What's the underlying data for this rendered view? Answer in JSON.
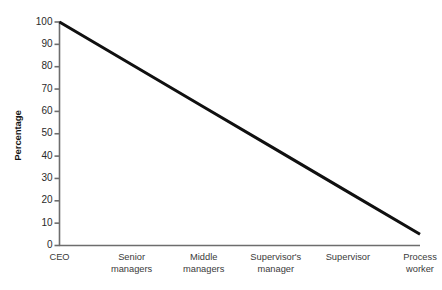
{
  "chart_data": {
    "type": "line",
    "title": "",
    "subtitle": "",
    "xlabel": "",
    "ylabel": "Percentage",
    "categories": [
      "CEO",
      "Senior\nmanagers",
      "Middle\nmanagers",
      "Supervisor's\nmanager",
      "Supervisor",
      "Process\nworker"
    ],
    "values": [
      100,
      81,
      62,
      43,
      24,
      5
    ],
    "ylim": [
      0,
      100
    ],
    "ytick_labels": [
      "0",
      "10",
      "20",
      "30",
      "40",
      "50",
      "60",
      "70",
      "80",
      "90",
      "100"
    ],
    "ytick_values": [
      0,
      10,
      20,
      30,
      40,
      50,
      60,
      70,
      80,
      90,
      100
    ],
    "grid": false,
    "legend": false,
    "legend_position": "none",
    "series": [
      {
        "name": "Percentage",
        "values": [
          100,
          81,
          62,
          43,
          24,
          5
        ],
        "color": "#101010",
        "line_width": 3
      }
    ],
    "colors": {
      "background": "#ffffff",
      "line": "#101010",
      "axis": "#6d6d6d",
      "tick_text": "#2a2a2a",
      "axis_title": "#131313"
    }
  }
}
